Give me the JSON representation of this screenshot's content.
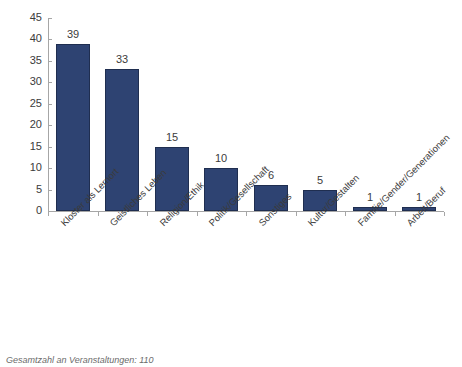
{
  "chart_data": {
    "type": "bar",
    "title": "",
    "xlabel": "",
    "ylabel": "",
    "ylim": [
      0,
      45
    ],
    "ytick_step": 5,
    "grid": false,
    "legend": "none",
    "bar_color": "#2e4372",
    "bar_border_color": "#1f2e50",
    "categories": [
      "Kloster als Lernort",
      "Geistliches Leben",
      "Religion/Ethik",
      "Politik/Gesellschaft",
      "Sonstiges",
      "Kultur/Gestalten",
      "Familie/Gender/Generationen",
      "Arbeit/Beruf"
    ],
    "values": [
      39,
      33,
      15,
      10,
      6,
      5,
      1,
      1
    ],
    "yticks": [
      0,
      5,
      10,
      15,
      20,
      25,
      30,
      35,
      40,
      45
    ],
    "ytick_labels": [
      "0",
      "5",
      "10",
      "15",
      "20",
      "25",
      "30",
      "35",
      "40",
      "45"
    ],
    "data_labels": [
      "39",
      "33",
      "15",
      "10",
      "6",
      "5",
      "1",
      "1"
    ],
    "annotation": "Gesamtzahl an Veranstaltungen: 110"
  },
  "footnote": {
    "text": "Gesamtzahl an Veranstaltungen: 110"
  },
  "header": {
    "title": ""
  }
}
